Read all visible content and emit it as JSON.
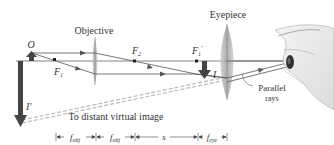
{
  "labels": {
    "objective": "Objective",
    "eyepiece": "Eyepiece",
    "object": "O",
    "f1": "F",
    "f1_sub": "1",
    "f2": "F",
    "f2_sub": "2",
    "f1_prime": "F",
    "f1_prime_sub": "1",
    "f1_prime_mark": "′",
    "image": "I",
    "image_final": "I′",
    "parallel_rays_line1": "Parallel",
    "parallel_rays_line2": "rays",
    "virtual_image": "To distant virtual image"
  },
  "dimensions": {
    "segment1": "f",
    "segment1_sub": "obj",
    "segment2": "f",
    "segment2_sub": "obj",
    "segment3": "s",
    "segment4": "f",
    "segment4_sub": "eye"
  },
  "colors": {
    "axis": "#555555",
    "ray": "#555555",
    "lens": "#a8a8a8",
    "arrow": "#444444",
    "dashed": "#b5b5b5",
    "text": "#333333"
  }
}
